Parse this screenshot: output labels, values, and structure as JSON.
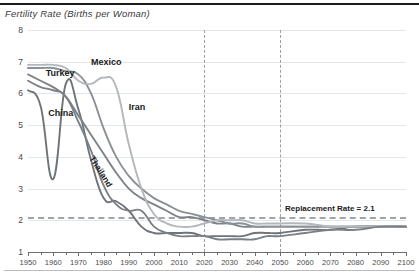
{
  "chart_title": "Fertility Rate (Births per Woman)",
  "annotation": {
    "replacement_label": "Replacement Rate = 2.1"
  },
  "series_labels": {
    "turkey": "Turkey",
    "mexico": "Mexico",
    "china": "China",
    "iran": "Iran",
    "thailand": "Thailand"
  },
  "chart_data": {
    "type": "line",
    "title": "Fertility Rate (Births per Woman)",
    "xlabel": "",
    "ylabel": "Fertility Rate (Births per Woman)",
    "xlim": [
      1950,
      2100
    ],
    "ylim": [
      1,
      8
    ],
    "yticks": [
      1,
      2,
      3,
      4,
      5,
      6,
      7,
      8
    ],
    "xticks": [
      1950,
      1960,
      1970,
      1980,
      1990,
      2000,
      2010,
      2020,
      2030,
      2040,
      2050,
      2060,
      2070,
      2080,
      2090,
      2100
    ],
    "grid": "horizontal",
    "legend": "inline-labels",
    "reference_lines": [
      {
        "type": "horizontal",
        "value": 2.1,
        "style": "dashed",
        "label": "Replacement Rate = 2.1",
        "color": "#9ea4a9"
      },
      {
        "type": "vertical",
        "value": 2020,
        "style": "dashed",
        "color": "#9aa0a6"
      },
      {
        "type": "vertical",
        "value": 2050,
        "style": "dashed",
        "color": "#9aa0a6"
      }
    ],
    "x": [
      1950,
      1955,
      1960,
      1965,
      1970,
      1975,
      1980,
      1985,
      1990,
      1995,
      2000,
      2005,
      2010,
      2015,
      2020,
      2025,
      2030,
      2035,
      2040,
      2045,
      2050,
      2060,
      2070,
      2080,
      2090,
      2100
    ],
    "series": [
      {
        "name": "China",
        "color": "#6e7478",
        "values": [
          6.1,
          5.6,
          3.3,
          6.3,
          5.5,
          3.9,
          2.7,
          2.6,
          2.3,
          1.8,
          1.6,
          1.6,
          1.6,
          1.6,
          1.5,
          1.5,
          1.5,
          1.5,
          1.6,
          1.6,
          1.6,
          1.7,
          1.7,
          1.8,
          1.8,
          1.8
        ]
      },
      {
        "name": "Turkey",
        "color": "#7d8388",
        "values": [
          6.6,
          6.4,
          6.2,
          5.9,
          5.3,
          4.7,
          4.1,
          3.5,
          3.0,
          2.7,
          2.5,
          2.3,
          2.1,
          2.1,
          2.0,
          1.9,
          1.9,
          1.8,
          1.8,
          1.8,
          1.8,
          1.8,
          1.8,
          1.8,
          1.8,
          1.8
        ]
      },
      {
        "name": "Mexico",
        "color": "#8a9095",
        "values": [
          6.8,
          6.8,
          6.8,
          6.7,
          6.6,
          6.0,
          4.9,
          4.0,
          3.4,
          3.0,
          2.7,
          2.5,
          2.3,
          2.2,
          2.1,
          2.0,
          1.9,
          1.9,
          1.8,
          1.8,
          1.8,
          1.8,
          1.8,
          1.8,
          1.8,
          1.8
        ]
      },
      {
        "name": "Iran",
        "color": "#b3b8bc",
        "values": [
          6.9,
          6.9,
          6.9,
          6.8,
          6.4,
          6.3,
          6.5,
          6.2,
          4.4,
          3.0,
          2.2,
          1.9,
          1.8,
          1.8,
          1.9,
          2.0,
          2.0,
          2.0,
          1.9,
          1.9,
          1.9,
          1.9,
          1.8,
          1.8,
          1.8,
          1.8
        ]
      },
      {
        "name": "Thailand",
        "color": "#7a8085",
        "values": [
          6.4,
          6.2,
          6.1,
          5.9,
          5.1,
          4.2,
          3.1,
          2.5,
          2.3,
          2.3,
          1.8,
          1.6,
          1.5,
          1.5,
          1.5,
          1.4,
          1.4,
          1.4,
          1.4,
          1.5,
          1.5,
          1.6,
          1.7,
          1.7,
          1.8,
          1.8
        ]
      }
    ]
  }
}
